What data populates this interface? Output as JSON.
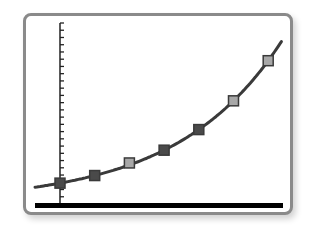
{
  "chart_data": {
    "type": "line",
    "title": "",
    "xlabel": "",
    "ylabel": "",
    "grid": false,
    "legend": null,
    "y_axis_ticks": 25,
    "points": [
      {
        "x": 0,
        "y": 1.0,
        "marker": "dark"
      },
      {
        "x": 1,
        "y": 1.4,
        "marker": "dark"
      },
      {
        "x": 2,
        "y": 2.2,
        "marker": "light"
      },
      {
        "x": 3,
        "y": 2.8,
        "marker": "dark"
      },
      {
        "x": 4,
        "y": 3.9,
        "marker": "dark"
      },
      {
        "x": 5,
        "y": 5.4,
        "marker": "light"
      },
      {
        "x": 6,
        "y": 7.4,
        "marker": "light"
      }
    ],
    "curve": "exponential growth fit",
    "colors": {
      "frame": "#8a8a8a",
      "curve": "#3a3a3a",
      "axis": "#222222",
      "baseline": "#000000",
      "marker_dark": "#4a4a4a",
      "marker_light": "#a8a8a8",
      "marker_border": "#3a3a3a"
    }
  }
}
